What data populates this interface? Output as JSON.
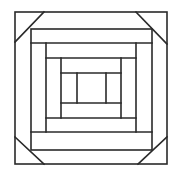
{
  "diagram": {
    "stroke_color": "#2a2a2a",
    "background_color": "#ffffff"
  }
}
